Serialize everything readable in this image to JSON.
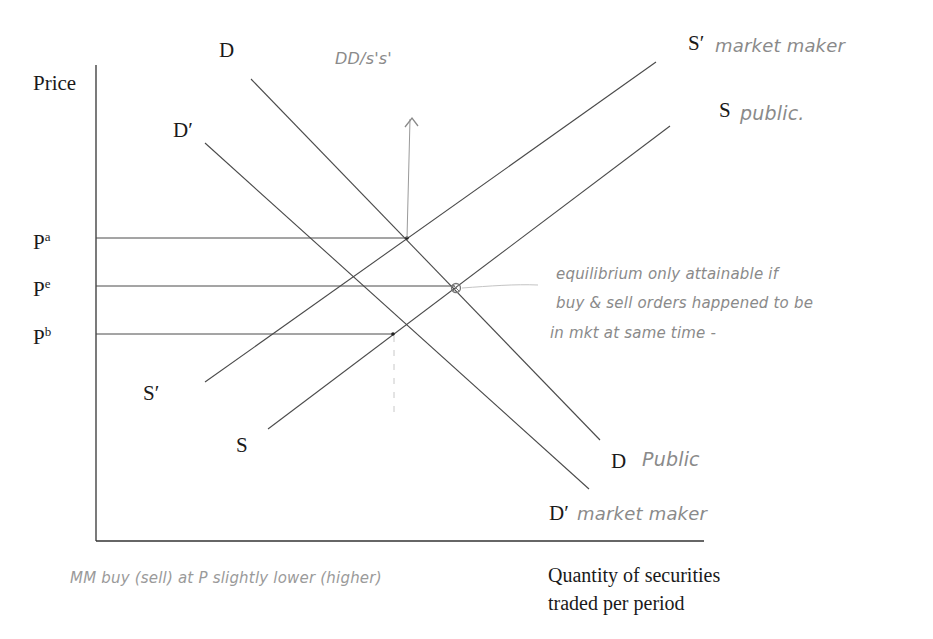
{
  "axes": {
    "y_label": "Price",
    "x_label_line1": "Quantity of securities",
    "x_label_line2": "traded per period"
  },
  "price_levels": [
    {
      "name": "Pa",
      "base": "P",
      "sup": "a",
      "y": 238,
      "x_end": 407
    },
    {
      "name": "Pe",
      "base": "P",
      "sup": "e",
      "y": 286,
      "x_end": 455
    },
    {
      "name": "Pb",
      "base": "P",
      "sup": "b",
      "y": 334,
      "x_end": 393
    }
  ],
  "curves": {
    "D": {
      "label_top": "D",
      "label_bottom": "D",
      "annotation": "Public",
      "x1": 251,
      "y1": 79,
      "x2": 600,
      "y2": 440
    },
    "D_prime": {
      "label_top": "D′",
      "label_bottom": "D′",
      "annotation": "market maker",
      "x1": 205,
      "y1": 143,
      "x2": 589,
      "y2": 489
    },
    "S_prime": {
      "label_top": "S′",
      "label_bottom": "S′",
      "annotation": "market maker",
      "x1": 205,
      "y1": 382,
      "x2": 656,
      "y2": 62
    },
    "S": {
      "label_top": "S",
      "label_bottom": "S",
      "annotation": "public.",
      "x1": 268,
      "y1": 429,
      "x2": 670,
      "y2": 126
    }
  },
  "annotations": {
    "shift_note": "DD/s's'",
    "equilibrium_note_line1": "equilibrium only attainable if",
    "equilibrium_note_line2": "buy & sell orders happened to be",
    "equilibrium_note_line3": "in mkt at same time  -",
    "bottom_note": "MM buy (sell) at P slightly lower (higher)"
  },
  "colors": {
    "ink": "#1a1a1a",
    "line": "#4a4a4a",
    "pencil": "#8a8a8a"
  }
}
